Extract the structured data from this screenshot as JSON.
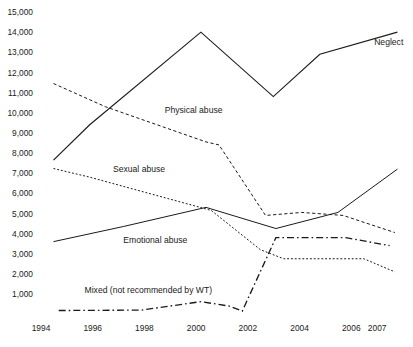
{
  "chart_data": {
    "type": "line",
    "title": "",
    "subtitle": "",
    "xlabel": "",
    "ylabel": "",
    "x": [
      1994,
      1995,
      1996,
      1997,
      1998,
      1999,
      2000,
      2001,
      2002,
      2003,
      2004,
      2005,
      2006,
      2007,
      2008
    ],
    "xlim": [
      1994,
      2008
    ],
    "ylim": [
      0,
      15000
    ],
    "grid": false,
    "legend_position": "inline-annotations",
    "x_ticks": [
      {
        "label": "1994",
        "value": 1994
      },
      {
        "label": "1996",
        "value": 1996
      },
      {
        "label": "1998",
        "value": 1998
      },
      {
        "label": "2000",
        "value": 2000
      },
      {
        "label": "2002",
        "value": 2002
      },
      {
        "label": "2004",
        "value": 2004
      },
      {
        "label": "2006",
        "value": 2006
      },
      {
        "label": "2007",
        "value": 2007
      }
    ],
    "y_ticks": [
      {
        "label": "15,000",
        "value": 15000
      },
      {
        "label": "14,000",
        "value": 14000
      },
      {
        "label": "13,000",
        "value": 13000
      },
      {
        "label": "12,000",
        "value": 12000
      },
      {
        "label": "11,000",
        "value": 11000
      },
      {
        "label": "10,000",
        "value": 10000
      },
      {
        "label": "9,000",
        "value": 9000
      },
      {
        "label": "8,000",
        "value": 8000
      },
      {
        "label": "7,000",
        "value": 7000
      },
      {
        "label": "6,000",
        "value": 6000
      },
      {
        "label": "5,000",
        "value": 5000
      },
      {
        "label": "4,000",
        "value": 4000
      },
      {
        "label": "3,000",
        "value": 3000
      },
      {
        "label": "2,000",
        "value": 2000
      },
      {
        "label": "1,000",
        "value": 1000
      }
    ],
    "series": [
      {
        "name": "Neglect",
        "style": "solid",
        "color": "#1a1a1a",
        "x": [
          1994.6,
          1996.0,
          2000.3,
          2003.1,
          2004.9,
          2007.9
        ],
        "values": [
          7650,
          9400,
          14000,
          10800,
          12900,
          14000
        ],
        "annotation": {
          "text": "Neglect",
          "x": 2007.0,
          "y": 13350
        }
      },
      {
        "name": "Physical abuse",
        "style": "dashed",
        "color": "#1a1a1a",
        "x": [
          1994.6,
          1996.6,
          2000.5,
          2001.0,
          2002.8,
          2004.2,
          2005.8,
          2007.8
        ],
        "values": [
          11450,
          10300,
          8550,
          8400,
          4900,
          5050,
          4900,
          4050
        ],
        "annotation": {
          "text": "Physical abuse",
          "x": 1998.9,
          "y": 10000
        }
      },
      {
        "name": "Sexual abuse",
        "style": "dotted",
        "color": "#1a1a1a",
        "x": [
          1994.6,
          1996.0,
          2000.7,
          2002.6,
          2003.5,
          2006.6,
          2007.8
        ],
        "values": [
          7230,
          6800,
          5150,
          3200,
          2750,
          2750,
          2100
        ],
        "annotation": {
          "text": "Sexual abuse",
          "x": 1996.9,
          "y": 7050
        }
      },
      {
        "name": "Emotional abuse",
        "style": "solid",
        "color": "#1a1a1a",
        "x": [
          1994.6,
          1997.3,
          2000.5,
          2003.2,
          2005.6,
          2007.9
        ],
        "values": [
          3600,
          4350,
          5300,
          4250,
          5050,
          7200
        ],
        "annotation": {
          "text": "Emotional abuse",
          "x": 1997.3,
          "y": 3550
        }
      },
      {
        "name": "Mixed (not recommended by WT)",
        "style": "dash-dot",
        "color": "#1a1a1a",
        "x": [
          1994.8,
          1998.0,
          2000.3,
          2001.4,
          2001.9,
          2003.2,
          2005.9,
          2007.6
        ],
        "values": [
          180,
          200,
          620,
          400,
          150,
          3800,
          3800,
          3400
        ],
        "annotation": {
          "text": "Mixed (not recommended by WT)",
          "x": 1995.8,
          "y": 1050
        }
      }
    ]
  }
}
